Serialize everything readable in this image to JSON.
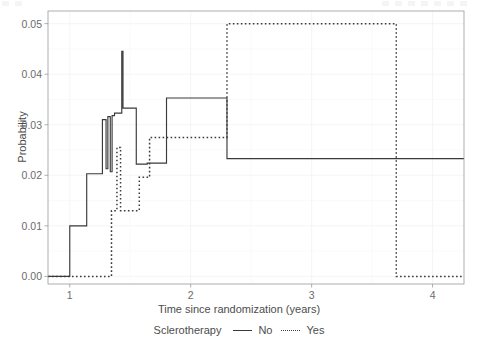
{
  "chart_data": {
    "type": "line",
    "title": "",
    "subtitle": "",
    "xlabel": "Time since randomization (years)",
    "ylabel": "Probability",
    "xlim": [
      0.82,
      4.26
    ],
    "ylim": [
      -0.0015,
      0.0525
    ],
    "xticks": [
      1,
      2,
      3,
      4
    ],
    "xtick_labels": [
      "1",
      "2",
      "3",
      "4"
    ],
    "yticks": [
      0.0,
      0.01,
      0.02,
      0.03,
      0.04,
      0.05
    ],
    "ytick_labels": [
      "0.00",
      "0.01",
      "0.02",
      "0.03",
      "0.04",
      "0.05"
    ],
    "grid": true,
    "grid_color": "#f2f2f2",
    "legend_position": "bottom",
    "legend_title": "Sclerotherapy",
    "step_type": "post",
    "series": [
      {
        "name": "No",
        "label": "No",
        "style": "solid",
        "color": "#3a3a3a",
        "x": [
          0.82,
          1.0,
          1.0,
          1.14,
          1.14,
          1.27,
          1.27,
          1.3,
          1.3,
          1.315,
          1.315,
          1.335,
          1.335,
          1.35,
          1.35,
          1.37,
          1.37,
          1.43,
          1.43,
          1.44,
          1.44,
          1.55,
          1.55,
          1.64,
          1.64,
          1.8,
          1.8,
          2.3,
          2.3,
          4.26
        ],
        "y": [
          0.0,
          0.0,
          0.01,
          0.01,
          0.0203,
          0.0203,
          0.031,
          0.031,
          0.0213,
          0.0213,
          0.0316,
          0.0316,
          0.0207,
          0.0207,
          0.0318,
          0.0318,
          0.0323,
          0.0323,
          0.0445,
          0.0445,
          0.0333,
          0.0333,
          0.0222,
          0.0222,
          0.0224,
          0.0224,
          0.0353,
          0.0353,
          0.0233,
          0.0233
        ]
      },
      {
        "name": "Yes",
        "label": "Yes",
        "style": "dotted",
        "color": "#3a3a3a",
        "x": [
          0.82,
          1.345,
          1.345,
          1.39,
          1.39,
          1.42,
          1.42,
          1.44,
          1.44,
          1.575,
          1.575,
          1.66,
          1.66,
          2.3,
          2.3,
          3.7,
          3.7,
          4.26
        ],
        "y": [
          0.0,
          0.0,
          0.013,
          0.013,
          0.0255,
          0.0255,
          0.013,
          0.013,
          0.013,
          0.013,
          0.0196,
          0.0196,
          0.0275,
          0.0275,
          0.05,
          0.05,
          0.0,
          0.0
        ]
      }
    ],
    "annotations": []
  },
  "axes": {
    "y_title": "Probability",
    "x_title": "Time since randomization (years)"
  },
  "legend": {
    "title": "Sclerotherapy",
    "entries": [
      {
        "label": "No",
        "style": "solid"
      },
      {
        "label": "Yes",
        "style": "dotted"
      }
    ]
  }
}
